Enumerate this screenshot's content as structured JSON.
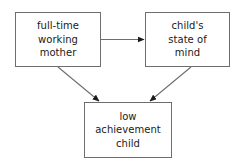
{
  "diagram": {
    "type": "flow-diagram",
    "background_color": "#ffffff",
    "line_color": "#6e6e6e",
    "arrow_color": "#1a1a1a",
    "text_color": "#1a1a1a",
    "nodes": [
      {
        "id": "mother",
        "lines": [
          "full-time",
          "working",
          "mother"
        ],
        "line1": "full-time",
        "line2": "working",
        "line3": "mother"
      },
      {
        "id": "state-of-mind",
        "lines": [
          "child's",
          "state of",
          "mind"
        ],
        "line1": "child's",
        "line2": "state of",
        "line3": "mind"
      },
      {
        "id": "low-achievement",
        "lines": [
          "low",
          "achievement",
          "child"
        ],
        "line1": "low",
        "line2": "achievement",
        "line3": "child"
      }
    ],
    "edges": [
      {
        "id": "mother-to-state-of-mind",
        "from": "mother",
        "to": "state-of-mind",
        "style": "horizontal-arrow"
      },
      {
        "id": "mother-to-low-achievement",
        "from": "mother",
        "to": "low-achievement",
        "style": "diagonal-arrow"
      },
      {
        "id": "state-of-mind-to-low-achievement",
        "from": "state-of-mind",
        "to": "low-achievement",
        "style": "diagonal-arrow"
      }
    ]
  }
}
